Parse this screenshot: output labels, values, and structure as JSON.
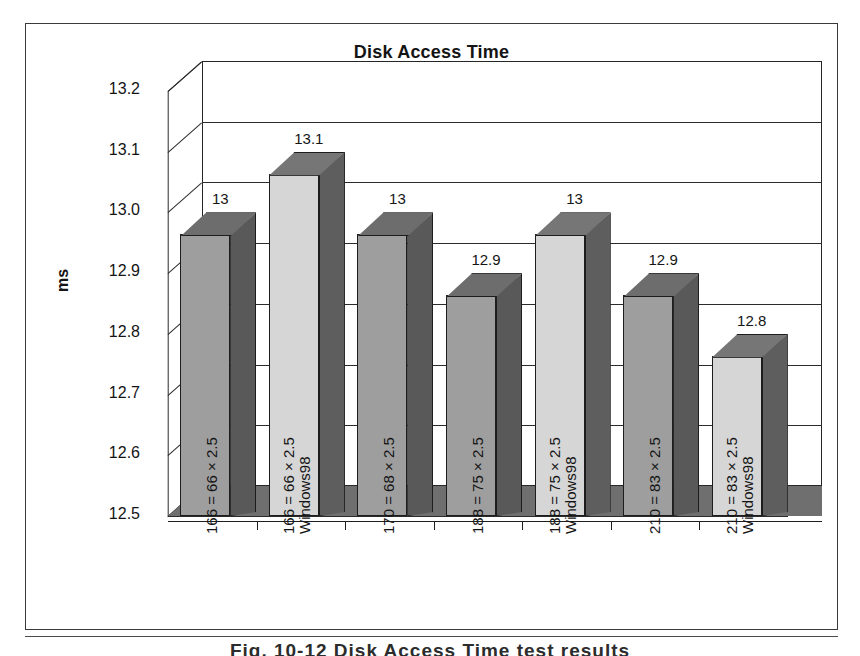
{
  "figure": {
    "title": "Disk Access Time",
    "caption": "Fig. 10-12  Disk Access Time test results"
  },
  "chart_data": {
    "type": "bar",
    "title": "Disk Access Time",
    "xlabel": "",
    "ylabel": "ms",
    "ylim": [
      12.5,
      13.2
    ],
    "ytick_step": 0.1,
    "grid": true,
    "legend": "none",
    "three_d": true,
    "categories": [
      "166 = 66 × 2.5",
      "166 = 66 × 2.5 Windows98",
      "170 = 68 × 2.5",
      "188 = 75 × 2.5",
      "188 = 75 × 2.5 Windows98",
      "210 = 83 × 2.5",
      "210 = 83 × 2.5 Windows98"
    ],
    "values": [
      13.0,
      13.1,
      13.0,
      12.9,
      13.0,
      12.9,
      12.8
    ],
    "data_labels": [
      "13",
      "13.1",
      "13",
      "12.9",
      "13",
      "12.9",
      "12.8"
    ],
    "yticks": [
      "13.2",
      "13.1",
      "13.0",
      "12.9",
      "12.8",
      "12.7",
      "12.6",
      "12.5"
    ],
    "bar_shades": [
      "dark",
      "light",
      "dark",
      "dark",
      "light",
      "dark",
      "light"
    ],
    "colors": {
      "bar_front_dark": "#9e9e9e",
      "bar_front_light": "#d6d6d6",
      "bar_side": "#5a5a5a",
      "bar_top": "#6d6d6d",
      "floor": "#6f6f6f",
      "axis": "#1f1f1f",
      "text": "#141414"
    }
  },
  "axes": {
    "y_label": "ms",
    "y_ticks": [
      {
        "text": "13.2",
        "value": 13.2
      },
      {
        "text": "13.1",
        "value": 13.1
      },
      {
        "text": "13.0",
        "value": 13.0
      },
      {
        "text": "12.9",
        "value": 12.9
      },
      {
        "text": "12.8",
        "value": 12.8
      },
      {
        "text": "12.7",
        "value": 12.7
      },
      {
        "text": "12.6",
        "value": 12.6
      },
      {
        "text": "12.5",
        "value": 12.5
      }
    ]
  },
  "bars": [
    {
      "label_line1": "166 = 66 × 2.5",
      "label_line2": "",
      "value_text": "13",
      "value": 13.0
    },
    {
      "label_line1": "166 = 66 × 2.5",
      "label_line2": "Windows98",
      "value_text": "13.1",
      "value": 13.1
    },
    {
      "label_line1": "170 = 68 × 2.5",
      "label_line2": "",
      "value_text": "13",
      "value": 13.0
    },
    {
      "label_line1": "188 = 75 × 2.5",
      "label_line2": "",
      "value_text": "12.9",
      "value": 12.9
    },
    {
      "label_line1": "188 = 75 × 2.5",
      "label_line2": "Windows98",
      "value_text": "13",
      "value": 13.0
    },
    {
      "label_line1": "210 = 83 × 2.5",
      "label_line2": "",
      "value_text": "12.9",
      "value": 12.9
    },
    {
      "label_line1": "210 = 83 × 2.5",
      "label_line2": "Windows98",
      "value_text": "12.8",
      "value": 12.8
    }
  ]
}
